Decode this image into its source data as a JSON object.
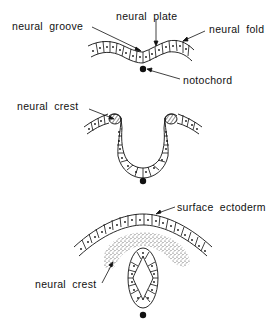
{
  "figure": {
    "type": "embryology diagram",
    "stages": [
      {
        "id": "stage-1",
        "labels": {
          "neural_groove": "neural groove",
          "neural_plate": "neural plate",
          "neural_fold": "neural fold",
          "notochord": "notochord"
        }
      },
      {
        "id": "stage-2",
        "labels": {
          "neural_crest": "neural crest"
        }
      },
      {
        "id": "stage-3",
        "labels": {
          "surface_ectoderm": "surface ectoderm",
          "neural_crest": "neural crest"
        }
      }
    ]
  },
  "colors": {
    "ink": "#111111",
    "background": "#ffffff",
    "stipple": "#444444"
  }
}
